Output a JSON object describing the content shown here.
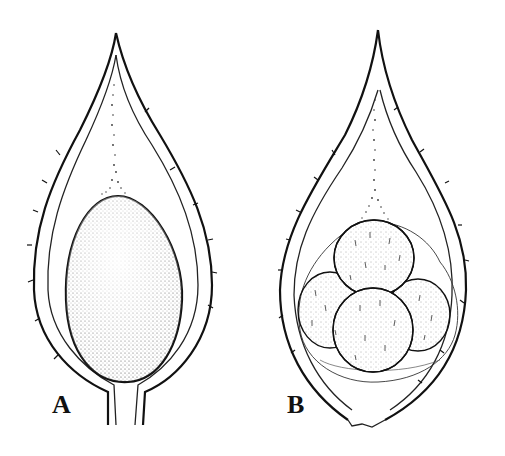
{
  "figure": {
    "panels": [
      {
        "label": "A",
        "description": "Fruit in longitudinal section showing a single ovoid stippled seed suspended by a funicle"
      },
      {
        "label": "B",
        "description": "Fruit in longitudinal section showing a cluster of four globose seeds enclosed in a membrane, suspended by a funicle"
      }
    ]
  }
}
